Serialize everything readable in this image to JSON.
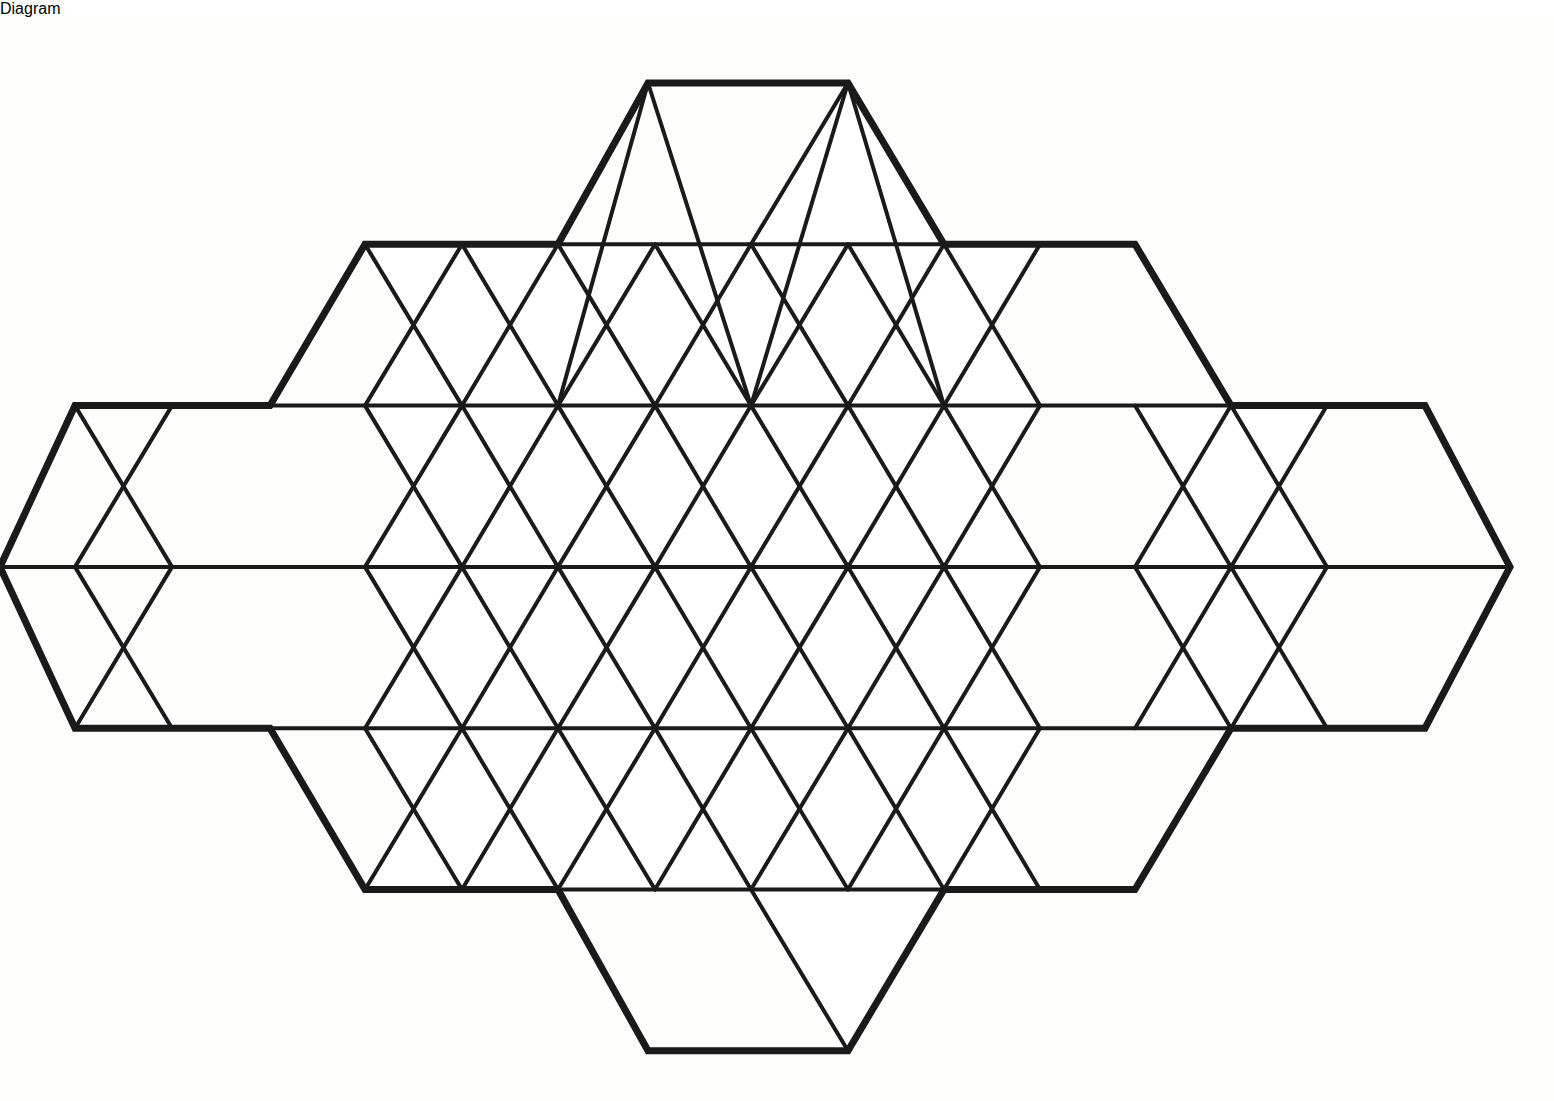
{
  "figure": {
    "shape_kind": "polyhedron-net",
    "background_color": "#fdfdfc",
    "line_color": "#1a1a1a",
    "face_color": "#ffffff",
    "stroke_width_major": 7,
    "stroke_width_minor": 4,
    "canvas": {
      "width": 1554,
      "height": 1083
    }
  },
  "geometry": {
    "column_step_px": 96.5,
    "edge_length_px": 193,
    "row_step_px": 161.3,
    "row_y": [
      65,
      226.3,
      387.6,
      548.9,
      710.2,
      871.5,
      1032.8
    ],
    "x_origin_px": -20,
    "rows": [
      {
        "index": 0,
        "y": 65,
        "x_min": 648,
        "x_max": 848,
        "vertex_x": [
          648,
          848
        ]
      },
      {
        "index": 1,
        "y": 226.3,
        "x_min": 365,
        "x_max": 1135,
        "vertex_x": [
          365,
          462,
          558,
          655,
          751,
          848,
          944,
          1040,
          1135
        ]
      },
      {
        "index": 2,
        "y": 387.6,
        "x_min": 75,
        "x_max": 1425,
        "vertex_x": [
          75,
          172,
          270,
          365,
          462,
          558,
          655,
          751,
          848,
          944,
          1040,
          1135,
          1231,
          1327,
          1425
        ]
      },
      {
        "index": 3,
        "y": 548.9,
        "x_min": 0,
        "x_max": 1510,
        "vertex_x": [
          0,
          75,
          172,
          270,
          365,
          462,
          558,
          655,
          751,
          848,
          944,
          1040,
          1135,
          1231,
          1327,
          1425,
          1510
        ]
      },
      {
        "index": 4,
        "y": 710.2,
        "x_min": 75,
        "x_max": 1425,
        "vertex_x": [
          75,
          172,
          270,
          365,
          462,
          558,
          655,
          751,
          848,
          944,
          1040,
          1135,
          1231,
          1327,
          1425
        ]
      },
      {
        "index": 5,
        "y": 871.5,
        "x_min": 365,
        "x_max": 1135,
        "vertex_x": [
          365,
          462,
          558,
          655,
          751,
          848,
          944,
          1040,
          1135
        ]
      },
      {
        "index": 6,
        "y": 1032.8,
        "x_min": 648,
        "x_max": 848,
        "vertex_x": [
          648,
          848
        ]
      }
    ],
    "horizontal_edges": [
      {
        "name": "row-0-top",
        "y": 65,
        "x1": 648,
        "x2": 848
      },
      {
        "name": "row-1",
        "y": 226.3,
        "x1": 365,
        "x2": 1135
      },
      {
        "name": "row-2",
        "y": 387.6,
        "x1": 75,
        "x2": 1425
      },
      {
        "name": "row-3-middle",
        "y": 548.9,
        "x1": 0,
        "x2": 1510
      },
      {
        "name": "row-4",
        "y": 710.2,
        "x1": 75,
        "x2": 1425
      },
      {
        "name": "row-5",
        "y": 871.5,
        "x1": 365,
        "x2": 1135
      },
      {
        "name": "row-6-bottom",
        "y": 1032.8,
        "x1": 648,
        "x2": 848
      }
    ],
    "bands": [
      {
        "name": "band-0",
        "y_top": 65,
        "y_bottom": 226.3,
        "top_x": [
          648,
          848
        ],
        "bottom_x": [
          558,
          655,
          751,
          848,
          944
        ]
      },
      {
        "name": "band-1",
        "y_top": 226.3,
        "y_bottom": 387.6,
        "top_x": [
          365,
          462,
          558,
          655,
          751,
          848,
          944,
          1040,
          1135
        ],
        "bottom_x": [
          270,
          365,
          462,
          558,
          655,
          751,
          848,
          944,
          1040,
          1135,
          1231
        ]
      },
      {
        "name": "band-2",
        "y_top": 387.6,
        "y_bottom": 548.9,
        "top_x": [
          75,
          172,
          270,
          365,
          462,
          558,
          655,
          751,
          848,
          944,
          1040,
          1135,
          1231,
          1327,
          1425
        ],
        "bottom_x": [
          0,
          75,
          172,
          270,
          365,
          462,
          558,
          655,
          751,
          848,
          944,
          1040,
          1135,
          1231,
          1327,
          1425,
          1510
        ]
      },
      {
        "name": "band-3",
        "y_top": 548.9,
        "y_bottom": 710.2,
        "top_x": [
          0,
          75,
          172,
          270,
          365,
          462,
          558,
          655,
          751,
          848,
          944,
          1040,
          1135,
          1231,
          1327,
          1425,
          1510
        ],
        "bottom_x": [
          75,
          172,
          270,
          365,
          462,
          558,
          655,
          751,
          848,
          944,
          1040,
          1135,
          1231,
          1327,
          1425
        ]
      },
      {
        "name": "band-4",
        "y_top": 710.2,
        "y_bottom": 871.5,
        "top_x": [
          270,
          365,
          462,
          558,
          655,
          751,
          848,
          944,
          1040,
          1135,
          1231
        ],
        "bottom_x": [
          365,
          462,
          558,
          655,
          751,
          848,
          944,
          1040,
          1135
        ]
      },
      {
        "name": "band-5",
        "y_top": 871.5,
        "y_bottom": 1032.8,
        "top_x": [
          558,
          655,
          751,
          848,
          944
        ],
        "bottom_x": [
          648,
          848
        ]
      }
    ],
    "diagonal_edges": [
      {
        "band": 0,
        "x1": 648,
        "y1": 65,
        "x2": 558,
        "y2": 387.6
      },
      {
        "band": 0,
        "x1": 648,
        "y1": 65,
        "x2": 751,
        "y2": 387.6
      },
      {
        "band": 0,
        "x1": 848,
        "y1": 65,
        "x2": 751,
        "y2": 387.6
      },
      {
        "band": 0,
        "x1": 848,
        "y1": 65,
        "x2": 944,
        "y2": 387.6
      }
    ]
  },
  "outline": {
    "name": "net-outline",
    "points": "648,65 848,65 944,226.3 1135,226.3 1231,387.6 1425,387.6 1510,548.9 1425,710.2 1231,710.2 1135,871.5 944,871.5 848,1032.8 648,1032.8 558,871.5 365,871.5 270,710.2 75,710.2 0,548.9 75,387.6 270,387.6 365,226.3 558,226.3"
  },
  "counts": {
    "rows": 7,
    "horizontal_lines": 7,
    "triangle_faces": 68
  }
}
